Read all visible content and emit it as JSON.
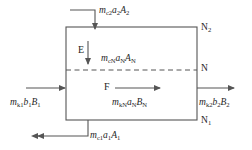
{
  "diagram": {
    "box": {
      "x": 66,
      "y": 27,
      "width": 131,
      "height": 93
    },
    "divider": {
      "y": 70,
      "style": "dashed"
    },
    "colors": {
      "stroke": "#555555",
      "text": "#262626",
      "background": "#ffffff"
    },
    "zones": [
      {
        "id": "E",
        "label": "E",
        "x": 78,
        "y": 45
      },
      {
        "id": "F",
        "label": "F",
        "x": 104,
        "y": 84
      }
    ],
    "node_labels": [
      {
        "id": "N2",
        "text": "N",
        "sub": "2",
        "x": 201,
        "y": 23
      },
      {
        "id": "N",
        "text": "N",
        "sub": "",
        "x": 201,
        "y": 64
      },
      {
        "id": "N1",
        "text": "N",
        "sub": "1",
        "x": 201,
        "y": 116
      }
    ],
    "streams": [
      {
        "id": "top-inlet",
        "direction": "down",
        "label_main": "m",
        "label_sub1": "c2",
        "label_mid": "a",
        "label_sub2": "2",
        "label_end": "A",
        "label_sub3": "2",
        "text": "mc2a2A2",
        "label_x": 99,
        "label_y": 6
      },
      {
        "id": "left-inlet",
        "direction": "right",
        "label_main": "m",
        "label_sub1": "k1",
        "label_mid": "b",
        "label_sub2": "1",
        "label_end": "B",
        "label_sub3": "1",
        "text": "mk1b1B1",
        "label_x": 10,
        "label_y": 98
      },
      {
        "id": "right-outlet",
        "direction": "right",
        "label_main": "m",
        "label_sub1": "k2",
        "label_mid": "b",
        "label_sub2": "2",
        "label_end": "B",
        "label_sub3": "2",
        "text": "mk2b2B2",
        "label_x": 199,
        "label_y": 98
      },
      {
        "id": "bottom-outlet",
        "direction": "left",
        "label_main": "m",
        "label_sub1": "c1",
        "label_mid": "a",
        "label_sub2": "1",
        "label_end": "A",
        "label_sub3": "1",
        "text": "mc1a1A1",
        "label_x": 90,
        "label_y": 131
      }
    ],
    "interior_labels": [
      {
        "id": "upper-interior",
        "label_main": "m",
        "label_sub1": "cN",
        "label_mid": "a",
        "label_sub2": "N",
        "label_end": "A",
        "label_sub3": "N",
        "text": "mcNaNAN",
        "label_x": 101,
        "label_y": 54
      },
      {
        "id": "lower-interior",
        "label_main": "m",
        "label_sub1": "kN",
        "label_mid": "a",
        "label_sub2": "N",
        "label_end": "B",
        "label_sub3": "N",
        "text": "mkNaNBN",
        "label_x": 112,
        "label_y": 98
      }
    ]
  }
}
